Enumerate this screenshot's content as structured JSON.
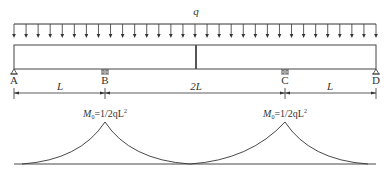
{
  "diagram": {
    "load": {
      "label": "q",
      "arrow_count": 31
    },
    "supports": [
      {
        "id": "A",
        "label": "A",
        "type": "pin"
      },
      {
        "id": "B",
        "label": "B",
        "type": "roller"
      },
      {
        "id": "C",
        "label": "C",
        "type": "roller"
      },
      {
        "id": "D",
        "label": "D",
        "type": "pin"
      }
    ],
    "spans": [
      {
        "label": "L"
      },
      {
        "label": "2L"
      },
      {
        "label": "L"
      }
    ],
    "moment_labels": [
      {
        "m": "M",
        "sub": "0",
        "eq": "=1/2qL",
        "sup": "2"
      },
      {
        "m": "M",
        "sub": "0",
        "eq": "=1/2qL",
        "sup": "2"
      }
    ]
  }
}
